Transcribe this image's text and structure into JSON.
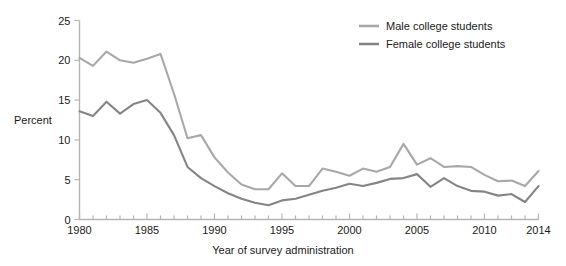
{
  "chart_data": {
    "type": "line",
    "title": "",
    "subtitle": "",
    "xlabel": "Year of survey administration",
    "ylabel": "Percent",
    "xlim": [
      1980,
      2014
    ],
    "ylim": [
      0,
      25
    ],
    "grid": false,
    "legend_position": "top-right",
    "x": [
      1980,
      1981,
      1982,
      1983,
      1984,
      1985,
      1986,
      1987,
      1988,
      1989,
      1990,
      1991,
      1992,
      1993,
      1994,
      1995,
      1996,
      1997,
      1998,
      1999,
      2000,
      2001,
      2002,
      2003,
      2004,
      2005,
      2006,
      2007,
      2008,
      2009,
      2010,
      2011,
      2012,
      2013,
      2014
    ],
    "xticks": [
      1980,
      1985,
      1990,
      1995,
      2000,
      2005,
      2010,
      2014
    ],
    "xtick_labels": [
      "1980",
      "1985",
      "1990",
      "1995",
      "2000",
      "2005",
      "2010",
      "2014"
    ],
    "yticks": [
      0,
      5,
      10,
      15,
      20,
      25
    ],
    "ytick_labels": [
      "0",
      "5",
      "10",
      "15",
      "20",
      "25"
    ],
    "series": [
      {
        "name": "Male college students",
        "color": "#a8a8a8",
        "values": [
          20.3,
          19.3,
          21.1,
          20.0,
          19.7,
          20.2,
          20.8,
          15.8,
          10.2,
          10.6,
          7.8,
          5.9,
          4.4,
          3.8,
          3.8,
          5.8,
          4.2,
          4.2,
          6.4,
          6.0,
          5.5,
          6.4,
          6.0,
          6.6,
          9.5,
          6.9,
          7.7,
          6.6,
          6.7,
          6.6,
          5.6,
          4.8,
          4.9,
          4.2,
          6.1
        ]
      },
      {
        "name": "Female college students",
        "color": "#858585",
        "values": [
          13.6,
          13.0,
          14.8,
          13.3,
          14.5,
          15.0,
          13.4,
          10.6,
          6.6,
          5.2,
          4.2,
          3.3,
          2.6,
          2.1,
          1.8,
          2.4,
          2.6,
          3.1,
          3.6,
          4.0,
          4.5,
          4.2,
          4.6,
          5.1,
          5.2,
          5.7,
          4.1,
          5.2,
          4.2,
          3.6,
          3.5,
          3.0,
          3.2,
          2.2,
          4.2
        ]
      }
    ]
  },
  "axis": {
    "ylabel": "Percent",
    "xlabel": "Year of survey administration"
  },
  "legend": {
    "items": [
      {
        "label": "Male college students",
        "color": "#a8a8a8"
      },
      {
        "label": "Female college students",
        "color": "#858585"
      }
    ]
  }
}
